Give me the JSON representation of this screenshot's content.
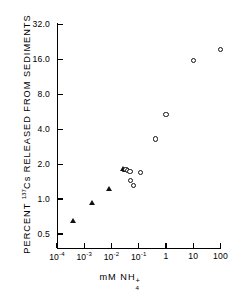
{
  "chart_data": {
    "type": "scatter",
    "title": "",
    "xlabel": "mM NH4+",
    "ylabel": "PERCENT 137Cs RELEASED FROM SEDIMENTS",
    "xscale": "log",
    "yscale": "log",
    "xlim": [
      0.0001,
      100
    ],
    "ylim": [
      0.4,
      32.0
    ],
    "grid": false,
    "legend": "none",
    "xticks": [
      {
        "value": 0.0001,
        "label": "10",
        "exp": "-4"
      },
      {
        "value": 0.001,
        "label": "10",
        "exp": "-3"
      },
      {
        "value": 0.01,
        "label": "10",
        "exp": "-2"
      },
      {
        "value": 0.1,
        "label": "10",
        "exp": "-1"
      },
      {
        "value": 1,
        "label": "1",
        "exp": ""
      },
      {
        "value": 10,
        "label": "10",
        "exp": ""
      },
      {
        "value": 100,
        "label": "100",
        "exp": ""
      }
    ],
    "yticks": [
      {
        "value": 32.0,
        "label": "32.0"
      },
      {
        "value": 16.0,
        "label": "16.0"
      },
      {
        "value": 8.0,
        "label": "8.0"
      },
      {
        "value": 4.0,
        "label": "4.0"
      },
      {
        "value": 2.0,
        "label": "2.0"
      },
      {
        "value": 1.0,
        "label": "1.0"
      },
      {
        "value": 0.5,
        "label": "0.5"
      }
    ],
    "series": [
      {
        "name": "filled-triangles",
        "marker": "triangle-filled",
        "points": [
          {
            "x": 0.0004,
            "y": 0.65
          },
          {
            "x": 0.002,
            "y": 0.93
          },
          {
            "x": 0.008,
            "y": 1.22
          },
          {
            "x": 0.028,
            "y": 1.82
          },
          {
            "x": 0.031,
            "y": 1.78
          }
        ]
      },
      {
        "name": "open-circles",
        "marker": "circle-open",
        "points": [
          {
            "x": 0.034,
            "y": 1.8
          },
          {
            "x": 0.038,
            "y": 1.76
          },
          {
            "x": 0.048,
            "y": 1.72
          },
          {
            "x": 0.05,
            "y": 1.44
          },
          {
            "x": 0.065,
            "y": 1.32
          },
          {
            "x": 0.115,
            "y": 1.7
          },
          {
            "x": 0.4,
            "y": 3.3
          },
          {
            "x": 1.0,
            "y": 5.4
          },
          {
            "x": 10.0,
            "y": 15.6
          },
          {
            "x": 100.0,
            "y": 19.5
          }
        ]
      }
    ]
  },
  "ylabel_parts": {
    "pre": "PERCENT ",
    "sup": "137",
    "post": "Cs RELEASED FROM SEDIMENTS"
  },
  "xlabel_parts": {
    "pre": "mM NH",
    "sub": "4",
    "sup": "+"
  }
}
